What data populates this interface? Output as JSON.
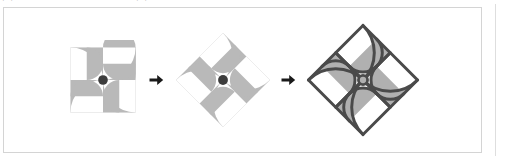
{
  "page": {
    "clipped_header_text": "图形的旋转与对称变换示意图",
    "background_color": "#ffffff"
  },
  "panel": {
    "border_color": "#d4d4d4",
    "background_color": "#ffffff"
  },
  "figure": {
    "shape_fill": "#b9b9b9",
    "shape_fill_outlined": "#b0b0b0",
    "hub_color": "#3d3d3d",
    "outline_color": "#4a4a4a",
    "arrow_color": "#1a1a1a",
    "stages": [
      {
        "id": "stage-1",
        "name": "square-pinwheel",
        "label": "",
        "rotation_deg": 0,
        "outlined": false,
        "hub": true,
        "petal_count": 4,
        "description": "square tile with four quarter-circle pinwheel petals"
      },
      {
        "id": "stage-2",
        "name": "rotated-pinwheel",
        "label": "",
        "rotation_deg": 45,
        "outlined": false,
        "hub": true,
        "petal_count": 4,
        "description": "same pinwheel rotated forty-five degrees"
      },
      {
        "id": "stage-3",
        "name": "outlined-pinwheel",
        "label": "",
        "rotation_deg": 45,
        "outlined": true,
        "hub": true,
        "petal_count": 4,
        "description": "rotated pinwheel with dark construction outlines"
      }
    ],
    "arrows": [
      {
        "id": "arrow-1",
        "name": "transform-arrow",
        "glyph": "➜",
        "direction": "right"
      },
      {
        "id": "arrow-2",
        "name": "transform-arrow",
        "glyph": "➜",
        "direction": "right"
      }
    ]
  },
  "right_rule": {
    "color": "#dedede"
  }
}
